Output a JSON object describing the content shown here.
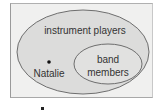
{
  "diagram": {
    "type": "venn-subset",
    "outer_set": {
      "label": "instrument players",
      "fill": "#dcdcdb",
      "stroke": "#6e6e6e"
    },
    "inner_set": {
      "label_line1": "band",
      "label_line2": "members",
      "fill": "#e1e1e0",
      "stroke": "#6e6e6e"
    },
    "element": {
      "label": "Natalie",
      "location": "instrument players, not band members"
    },
    "background": "#f0f0ef"
  }
}
